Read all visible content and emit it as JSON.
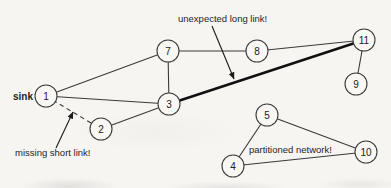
{
  "diagram": {
    "background": "#f6f5f2",
    "ink": "#2b2b2b",
    "node_radius": 11,
    "nodes": [
      {
        "id": "1",
        "x": 46,
        "y": 96
      },
      {
        "id": "2",
        "x": 101,
        "y": 129
      },
      {
        "id": "3",
        "x": 169,
        "y": 104
      },
      {
        "id": "7",
        "x": 168,
        "y": 51
      },
      {
        "id": "8",
        "x": 257,
        "y": 51
      },
      {
        "id": "11",
        "x": 364,
        "y": 40
      },
      {
        "id": "9",
        "x": 356,
        "y": 84
      },
      {
        "id": "5",
        "x": 267,
        "y": 115
      },
      {
        "id": "4",
        "x": 233,
        "y": 166
      },
      {
        "id": "10",
        "x": 366,
        "y": 152
      }
    ],
    "edges": [
      {
        "from": "1",
        "to": "7",
        "style": "normal"
      },
      {
        "from": "1",
        "to": "3",
        "style": "normal"
      },
      {
        "from": "1",
        "to": "2",
        "style": "dashed"
      },
      {
        "from": "2",
        "to": "3",
        "style": "normal"
      },
      {
        "from": "3",
        "to": "7",
        "style": "normal"
      },
      {
        "from": "7",
        "to": "8",
        "style": "normal"
      },
      {
        "from": "8",
        "to": "11",
        "style": "normal"
      },
      {
        "from": "3",
        "to": "11",
        "style": "thick"
      },
      {
        "from": "11",
        "to": "9",
        "style": "normal"
      },
      {
        "from": "4",
        "to": "5",
        "style": "normal"
      },
      {
        "from": "5",
        "to": "10",
        "style": "normal"
      },
      {
        "from": "4",
        "to": "10",
        "style": "normal"
      }
    ],
    "annotations": [
      {
        "name": "sink-label",
        "text": "sink",
        "x": 33,
        "y": 100,
        "anchor": "end",
        "bold": true
      },
      {
        "name": "unexpected-long-link-label",
        "text": "unexpected long link!",
        "x": 178,
        "y": 22,
        "anchor": "start",
        "bold": false
      },
      {
        "name": "missing-short-link-label",
        "text": "missing short link!",
        "x": 15,
        "y": 156,
        "anchor": "start",
        "bold": false
      },
      {
        "name": "partitioned-network-label",
        "text": "partitioned network!",
        "x": 249,
        "y": 153,
        "anchor": "start",
        "bold": false
      }
    ],
    "callout_arrows": [
      {
        "name": "arrow-to-unexpected-long-link",
        "x1": 212,
        "y1": 26,
        "x2": 234,
        "y2": 79
      },
      {
        "name": "arrow-to-missing-short-link",
        "x1": 56,
        "y1": 148,
        "x2": 73,
        "y2": 112
      }
    ]
  }
}
